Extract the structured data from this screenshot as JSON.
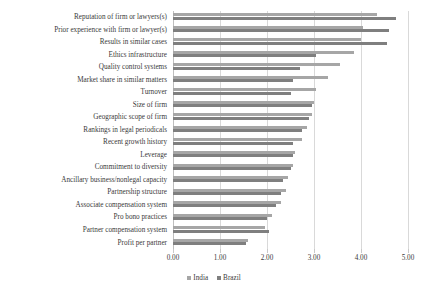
{
  "chart_data": {
    "type": "bar",
    "orientation": "horizontal",
    "title": "",
    "xlabel": "",
    "ylabel": "",
    "xlim": [
      0,
      5
    ],
    "xticks": [
      "0.00",
      "1.00",
      "2.00",
      "3.00",
      "4.00",
      "5.00"
    ],
    "xtick_values": [
      0,
      1,
      2,
      3,
      4,
      5
    ],
    "grid": true,
    "legend_position": "bottom",
    "categories": [
      "Reputation of firm or lawyers(s)",
      "Prior experience with firm or lawyer(s)",
      "Results in similar cases",
      "Ethics infrastructure",
      "Quality control systems",
      "Market share in similar matters",
      "Turnover",
      "Size of firm",
      "Geographic scope of firm",
      "Rankings in legal periodicals",
      "Recent growth history",
      "Leverage",
      "Commitment to diversity",
      "Ancillary business/nonlegal capacity",
      "Partnership structure",
      "Associate compensation system",
      "Pro bono practices",
      "Partner compensation system",
      "Profit per partner"
    ],
    "series": [
      {
        "name": "India",
        "color": "#a6a6a6",
        "values": [
          4.35,
          4.05,
          4.0,
          3.85,
          3.55,
          3.3,
          3.05,
          3.0,
          2.95,
          2.85,
          2.75,
          2.6,
          2.55,
          2.45,
          2.4,
          2.3,
          2.1,
          1.95,
          1.6
        ]
      },
      {
        "name": "Brazil",
        "color": "#7f7f7f",
        "values": [
          4.75,
          4.6,
          4.55,
          3.05,
          2.7,
          2.55,
          2.5,
          2.95,
          2.9,
          2.75,
          2.55,
          2.55,
          2.5,
          2.35,
          2.3,
          2.2,
          2.0,
          2.05,
          1.55
        ]
      }
    ]
  },
  "legend": {
    "items": [
      {
        "label": "India"
      },
      {
        "label": "Brazil"
      }
    ]
  }
}
